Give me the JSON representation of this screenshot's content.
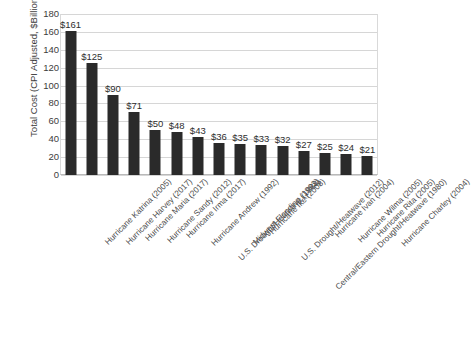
{
  "chart_data": {
    "type": "bar",
    "title": "",
    "xlabel": "",
    "ylabel": "Total Cost (CPI Adjusted, $Billions)",
    "ylim": [
      0,
      180
    ],
    "yticks": [
      0,
      20,
      40,
      60,
      80,
      100,
      120,
      140,
      160,
      180
    ],
    "ytick_labels": [
      "0",
      "20",
      "40",
      "60",
      "80",
      "100",
      "120",
      "140",
      "160",
      "180"
    ],
    "grid": true,
    "legend": false,
    "bar_color": "#2a2a2a",
    "categories": [
      "Hurricane Katrina (2005)",
      "Hurricane Harvey (2017)",
      "Hurricane Maria (2017)",
      "Hurricane Sandy (2012)",
      "Hurricane Irma (2017)",
      "Hurricane Andrew (1992)",
      "U.S. Drought/Heatwave (1988)",
      "Midwest Flooding (1993)",
      "Hurricane Ike (2008)",
      "U.S. Drought/Heatwave (2012)",
      "Central/Eastern Drought/Heatwave (1980)",
      "Hurricane Ivan (2004)",
      "Hurricane Wilma (2005)",
      "Hurricane Rita (2005)",
      "Hurricane Charley (2004)"
    ],
    "values": [
      161,
      125,
      90,
      71,
      50,
      48,
      43,
      36,
      35,
      33,
      32,
      27,
      25,
      24,
      21
    ],
    "data_labels": [
      "$161",
      "$125",
      "$90",
      "$71",
      "$50",
      "$48",
      "$43",
      "$36",
      "$35",
      "$33",
      "$32",
      "$27",
      "$25",
      "$24",
      "$21"
    ]
  },
  "caption": {
    "sliver_text": ""
  }
}
